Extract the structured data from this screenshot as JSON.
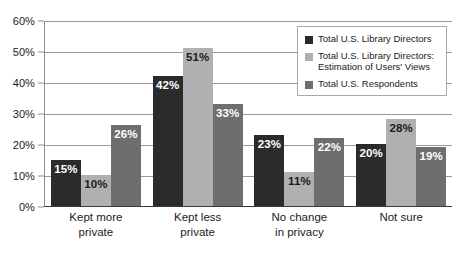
{
  "chart_data": {
    "type": "bar",
    "title": "",
    "subtitle": "",
    "xlabel": "",
    "ylabel": "",
    "ylim": [
      0,
      60
    ],
    "ytick_labels": [
      "0%",
      "10%",
      "20%",
      "30%",
      "40%",
      "50%",
      "60%"
    ],
    "ytick_values": [
      0,
      10,
      20,
      30,
      40,
      50,
      60
    ],
    "grid": true,
    "legend_position": "top-right",
    "categories": [
      [
        "Kept more",
        "private"
      ],
      [
        "Kept less",
        "private"
      ],
      [
        "No change",
        "in privacy"
      ],
      [
        "Not sure",
        ""
      ]
    ],
    "series": [
      {
        "name": "Total U.S. Library Directors",
        "color": "#2b2b2b",
        "label_color": "#ffffff",
        "values": [
          15,
          42,
          23,
          20
        ],
        "value_labels": [
          "15%",
          "42%",
          "23%",
          "20%"
        ]
      },
      {
        "name": "Total U.S. Library Directors: Estimation of Users' Views",
        "color": "#b0b0b0",
        "label_color": "#1b1b1b",
        "values": [
          10,
          51,
          11,
          28
        ],
        "value_labels": [
          "10%",
          "51%",
          "11%",
          "28%"
        ]
      },
      {
        "name": "Total U.S. Respondents",
        "color": "#6e6e6e",
        "label_color": "#ffffff",
        "values": [
          26,
          33,
          22,
          19
        ],
        "value_labels": [
          "26%",
          "33%",
          "22%",
          "19%"
        ]
      }
    ]
  },
  "legend": {
    "items": [
      {
        "label": "Total U.S. Library Directors"
      },
      {
        "label": "Total U.S. Library Directors: Estimation of Users' Views"
      },
      {
        "label": "Total U.S. Respondents"
      }
    ]
  }
}
